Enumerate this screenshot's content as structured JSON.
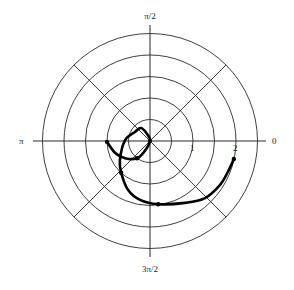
{
  "chart_data": {
    "type": "line",
    "coordinate_system": "polar",
    "title": "",
    "angle_labels": {
      "0": "0",
      "90": "π/2",
      "180": "π",
      "270": "3π/2"
    },
    "radial_tick_labels": [
      "1",
      "2"
    ],
    "radial_rings": [
      0.5,
      1.0,
      1.5,
      2.0,
      2.5
    ],
    "radial_lines_deg": [
      0,
      45,
      90,
      135,
      180,
      225,
      270,
      315
    ],
    "rlim": [
      0,
      2.5
    ],
    "grid": true,
    "series": [
      {
        "name": "curve",
        "style": "thick black line with point markers",
        "points_xy": [
          {
            "x": -1.0,
            "y": -0.02,
            "marker": true
          },
          {
            "x": -0.81,
            "y": -0.28
          },
          {
            "x": -0.58,
            "y": -0.4
          },
          {
            "x": -0.3,
            "y": -0.4,
            "marker": true
          },
          {
            "x": -0.12,
            "y": -0.23
          },
          {
            "x": 0.0,
            "y": 0.0
          },
          {
            "x": -0.05,
            "y": 0.14
          },
          {
            "x": -0.21,
            "y": 0.3
          },
          {
            "x": -0.35,
            "y": 0.21
          },
          {
            "x": -0.58,
            "y": 0.02
          },
          {
            "x": -0.7,
            "y": -0.44
          },
          {
            "x": -0.67,
            "y": -0.74,
            "marker": true
          },
          {
            "x": -0.51,
            "y": -1.14
          },
          {
            "x": -0.23,
            "y": -1.37
          },
          {
            "x": 0.19,
            "y": -1.47,
            "marker": true
          },
          {
            "x": 0.81,
            "y": -1.44
          },
          {
            "x": 1.28,
            "y": -1.33
          },
          {
            "x": 1.63,
            "y": -1.02
          },
          {
            "x": 1.81,
            "y": -0.72
          },
          {
            "x": 1.95,
            "y": -0.42,
            "marker": true
          }
        ]
      }
    ]
  },
  "labels": {
    "top": "π/2",
    "bottom": "3π/2",
    "left": "π",
    "right": "0",
    "tick_1": "1",
    "tick_2": "2"
  },
  "colors": {
    "grid": "#2a2a2a",
    "curve": "#000000",
    "background": "#ffffff"
  }
}
